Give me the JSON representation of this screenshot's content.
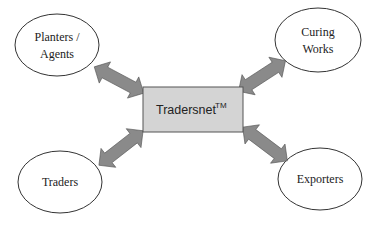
{
  "diagram": {
    "hub": {
      "label": "Tradersnet",
      "trademark": "TM",
      "fill": "#d4d4d4"
    },
    "nodes": [
      {
        "id": "planters",
        "line1": "Planters /",
        "line2": "Agents"
      },
      {
        "id": "curing",
        "line1": "Curing",
        "line2": "Works"
      },
      {
        "id": "traders",
        "line1": "Traders"
      },
      {
        "id": "exporters",
        "line1": "Exporters"
      }
    ],
    "connectors": [
      {
        "from": "planters",
        "to": "hub",
        "type": "bidirectional-arrow"
      },
      {
        "from": "curing",
        "to": "hub",
        "type": "bidirectional-arrow"
      },
      {
        "from": "traders",
        "to": "hub",
        "type": "bidirectional-arrow"
      },
      {
        "from": "exporters",
        "to": "hub",
        "type": "bidirectional-arrow"
      }
    ],
    "colors": {
      "arrow": "#8a8a8a",
      "outline": "#333333",
      "hub_fill": "#d4d4d4"
    }
  }
}
